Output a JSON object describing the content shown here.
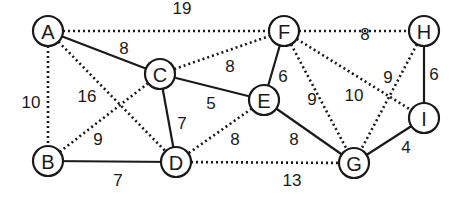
{
  "diagram": {
    "type": "weighted-undirected-graph",
    "node_radius": 15,
    "nodes": [
      {
        "id": "A",
        "label": "A",
        "x": 48,
        "y": 31
      },
      {
        "id": "B",
        "label": "B",
        "x": 48,
        "y": 161
      },
      {
        "id": "C",
        "label": "C",
        "x": 160,
        "y": 74
      },
      {
        "id": "D",
        "label": "D",
        "x": 176,
        "y": 162
      },
      {
        "id": "E",
        "label": "E",
        "x": 264,
        "y": 100
      },
      {
        "id": "F",
        "label": "F",
        "x": 284,
        "y": 31
      },
      {
        "id": "G",
        "label": "G",
        "x": 354,
        "y": 163
      },
      {
        "id": "H",
        "label": "H",
        "x": 424,
        "y": 31
      },
      {
        "id": "I",
        "label": "I",
        "x": 424,
        "y": 118
      }
    ],
    "edges": [
      {
        "from": "A",
        "to": "F",
        "weight": "19",
        "style": "dotted",
        "lx": 182,
        "ly": 8
      },
      {
        "from": "F",
        "to": "H",
        "weight": "8",
        "style": "dotted",
        "lx": 365,
        "ly": 34
      },
      {
        "from": "A",
        "to": "C",
        "weight": "8",
        "style": "solid",
        "lx": 124,
        "ly": 48
      },
      {
        "from": "A",
        "to": "B",
        "weight": "10",
        "style": "dotted",
        "lx": 31,
        "ly": 102
      },
      {
        "from": "A",
        "to": "D",
        "weight": "16",
        "style": "dotted",
        "lx": 87,
        "ly": 96
      },
      {
        "from": "C",
        "to": "F",
        "weight": "8",
        "style": "dotted",
        "lx": 230,
        "ly": 66
      },
      {
        "from": "C",
        "to": "E",
        "weight": "5",
        "style": "solid",
        "lx": 211,
        "ly": 103
      },
      {
        "from": "C",
        "to": "D",
        "weight": "7",
        "style": "solid",
        "lx": 182,
        "ly": 123
      },
      {
        "from": "C",
        "to": "B",
        "weight": "9",
        "style": "dotted",
        "lx": 98,
        "ly": 139
      },
      {
        "from": "F",
        "to": "E",
        "weight": "6",
        "style": "solid",
        "lx": 283,
        "ly": 76
      },
      {
        "from": "F",
        "to": "G",
        "weight": "9",
        "style": "dotted",
        "lx": 312,
        "ly": 99
      },
      {
        "from": "F",
        "to": "I",
        "weight": "10",
        "style": "dotted",
        "lx": 354,
        "ly": 95
      },
      {
        "from": "H",
        "to": "G",
        "weight": "9",
        "style": "dotted",
        "lx": 388,
        "ly": 77
      },
      {
        "from": "H",
        "to": "I",
        "weight": "6",
        "style": "solid",
        "lx": 434,
        "ly": 74
      },
      {
        "from": "E",
        "to": "D",
        "weight": "8",
        "style": "dotted",
        "lx": 235,
        "ly": 139
      },
      {
        "from": "E",
        "to": "G",
        "weight": "8",
        "style": "solid",
        "lx": 294,
        "ly": 139
      },
      {
        "from": "B",
        "to": "D",
        "weight": "7",
        "style": "solid",
        "lx": 118,
        "ly": 180
      },
      {
        "from": "D",
        "to": "G",
        "weight": "13",
        "style": "dotted",
        "lx": 292,
        "ly": 180
      },
      {
        "from": "G",
        "to": "I",
        "weight": "4",
        "style": "solid",
        "lx": 406,
        "ly": 147
      }
    ]
  }
}
